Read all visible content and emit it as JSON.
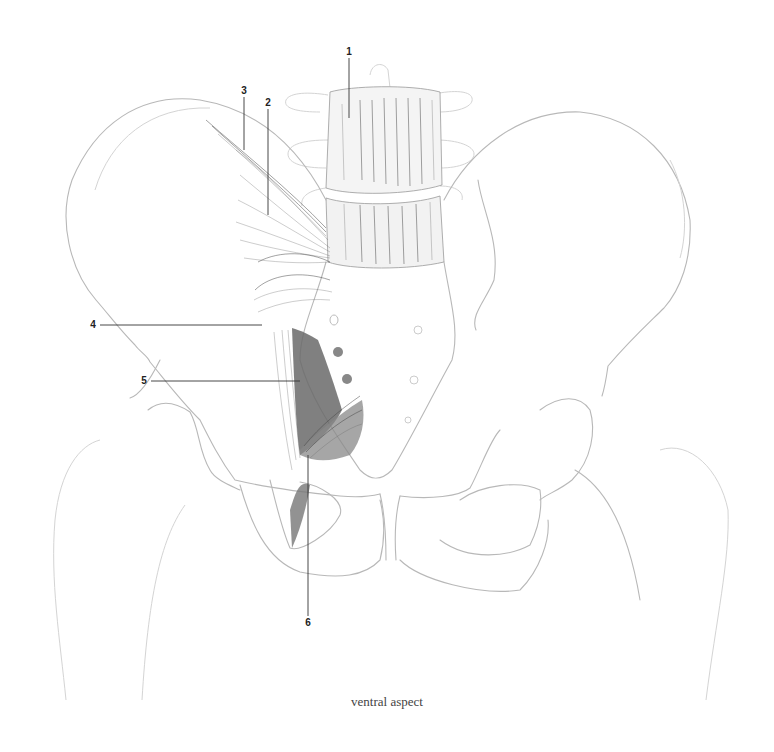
{
  "figure": {
    "caption": "ventral aspect",
    "labels": [
      {
        "id": "1",
        "text": "1",
        "x": 349,
        "y": 52
      },
      {
        "id": "2",
        "text": "2",
        "x": 268,
        "y": 103
      },
      {
        "id": "3",
        "text": "3",
        "x": 244,
        "y": 91
      },
      {
        "id": "4",
        "text": "4",
        "x": 93,
        "y": 325
      },
      {
        "id": "5",
        "text": "5",
        "x": 144,
        "y": 381
      },
      {
        "id": "6",
        "text": "6",
        "x": 308,
        "y": 623
      }
    ]
  }
}
